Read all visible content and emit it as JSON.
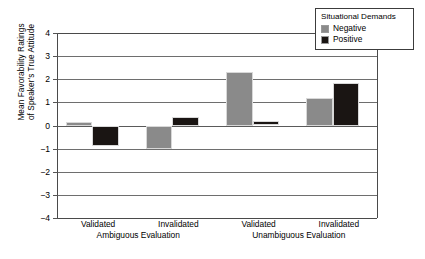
{
  "chart_data": {
    "type": "bar",
    "title": "",
    "xlabel": "",
    "ylabel_line1": "Mean Favorability Ratings",
    "ylabel_line2": "of Speaker's True Attitude",
    "ylim": [
      -4,
      4
    ],
    "yticks": [
      "4",
      "3",
      "2",
      "1",
      "0",
      "−1",
      "−2",
      "−3",
      "−4"
    ],
    "ytick_values": [
      4,
      3,
      2,
      1,
      0,
      -1,
      -2,
      -3,
      -4
    ],
    "grid": true,
    "legend_position": "top-right",
    "categories": [
      "Validated",
      "Invalidated",
      "Validated",
      "Invalidated"
    ],
    "group_labels": [
      "Ambiguous Evaluation",
      "Unambiguous Evaluation"
    ],
    "series": [
      {
        "name": "Negative",
        "color": "#8a8a8a",
        "values": [
          0.15,
          -1.0,
          2.3,
          1.2
        ]
      },
      {
        "name": "Positive",
        "color": "#1a1513",
        "values": [
          -0.9,
          0.35,
          0.18,
          1.85
        ]
      }
    ]
  },
  "legend": {
    "title": "Situational Demands",
    "entries": [
      {
        "label": "Negative",
        "color": "#8a8a8a"
      },
      {
        "label": "Positive",
        "color": "#1a1513"
      }
    ]
  }
}
